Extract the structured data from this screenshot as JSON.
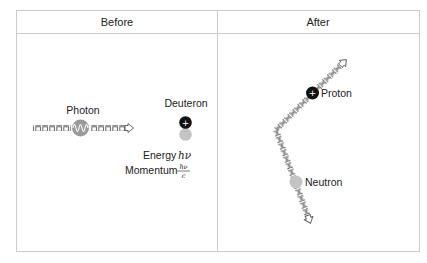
{
  "panels": {
    "before": {
      "title": "Before"
    },
    "after": {
      "title": "After"
    }
  },
  "before": {
    "photon_label": "Photon",
    "deuteron_label": "Deuteron",
    "energy_label": "Energy",
    "energy_symbol": "hν",
    "momentum_label": "Momentum",
    "momentum_numerator": "hν",
    "momentum_denominator": "c",
    "proton_symbol": "+"
  },
  "after": {
    "proton_label": "Proton",
    "neutron_label": "Neutron",
    "proton_symbol": "+"
  },
  "colors": {
    "proton": "#111111",
    "neutron": "#c4c4c4",
    "photon": "#9a9a9a",
    "border": "#cccccc"
  }
}
